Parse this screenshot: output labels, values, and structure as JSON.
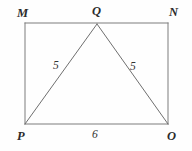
{
  "figure": {
    "background_color": "#fefefe",
    "stroke_color": "#777777",
    "text_color": "#2b2b2b",
    "stroke_width": 1,
    "width": 192,
    "height": 151,
    "vertices": [
      {
        "id": "M",
        "label": "M",
        "x": 25,
        "y": 23,
        "role": "rectangle-top-left"
      },
      {
        "id": "Q",
        "label": "Q",
        "x": 97,
        "y": 24,
        "role": "triangle-apex-on-top-edge"
      },
      {
        "id": "N",
        "label": "N",
        "x": 168,
        "y": 23,
        "role": "rectangle-top-right"
      },
      {
        "id": "P",
        "label": "P",
        "x": 25,
        "y": 124,
        "role": "rectangle-bottom-left"
      },
      {
        "id": "O",
        "label": "O",
        "x": 168,
        "y": 124,
        "role": "rectangle-bottom-right"
      }
    ],
    "segments": [
      {
        "id": "MN",
        "from": "M",
        "to": "N",
        "kind": "rectangle-top"
      },
      {
        "id": "NO",
        "from": "N",
        "to": "O",
        "kind": "rectangle-right"
      },
      {
        "id": "OP",
        "from": "O",
        "to": "P",
        "kind": "rectangle-bottom"
      },
      {
        "id": "PM",
        "from": "P",
        "to": "M",
        "kind": "rectangle-left"
      },
      {
        "id": "PQ",
        "from": "P",
        "to": "Q",
        "kind": "triangle-side",
        "measure": "5"
      },
      {
        "id": "QO",
        "from": "Q",
        "to": "O",
        "kind": "triangle-side",
        "measure": "5"
      },
      {
        "id": "PO",
        "from": "P",
        "to": "O",
        "kind": "triangle-base",
        "measure": "6"
      }
    ],
    "measures": {
      "side_left": "5",
      "side_right": "5",
      "base": "6"
    }
  }
}
